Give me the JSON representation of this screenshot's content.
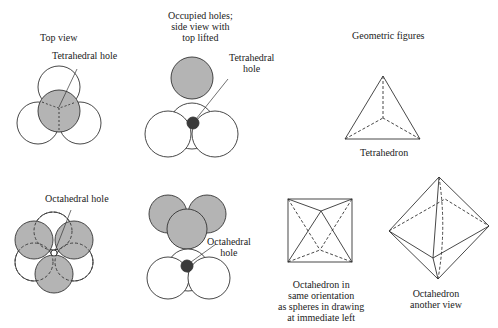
{
  "column_headers": {
    "top_view": "Top view",
    "occupied_holes": [
      "Occupied holes;",
      "side view with",
      "top lifted"
    ],
    "geometric_figures": "Geometric figures"
  },
  "annotations": {
    "tetrahedral_hole_top": "Tetrahedral hole",
    "tetrahedral_hole_side": [
      "Tetrahedral",
      "hole"
    ],
    "octahedral_hole_top": "Octahedral hole",
    "octahedral_hole_side": [
      "Octahedral",
      "hole"
    ]
  },
  "captions": {
    "tetrahedron": "Tetrahedron",
    "octahedron_same": [
      "Octahedron in",
      "same orientation",
      "as spheres in drawing",
      "at immediate left"
    ],
    "octahedron_other": [
      "Octahedron",
      "another view"
    ]
  },
  "colors": {
    "sphere_gray": "#b4b4b4",
    "hole_dark": "#3a3a3a",
    "stroke": "#333333"
  }
}
